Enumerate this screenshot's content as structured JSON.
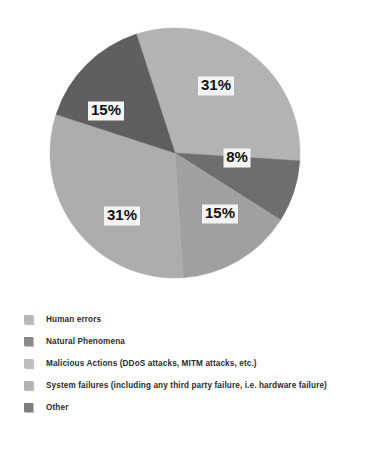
{
  "chart_data": {
    "type": "pie",
    "title": "",
    "subtitle": "",
    "xlabel": "",
    "ylabel": "",
    "legend_position": "bottom-left",
    "grid": false,
    "categories": [
      "Human errors",
      "Natural Phenomena",
      "Malicious Actions (DDoS attacks, MITM attacks, etc.)",
      "System failures (including any third party failure, i.e. hardware failure)",
      "Other"
    ],
    "values": [
      31,
      8,
      15,
      31,
      15
    ],
    "value_labels": [
      "31%",
      "8%",
      "15%",
      "31%",
      "15%"
    ],
    "colors": [
      "#b3b3b3",
      "#6e6e6e",
      "#a0a0a0",
      "#adadad",
      "#5f5f5f"
    ],
    "start_angle_deg": -18,
    "slices": [
      {
        "name": "Human errors",
        "value": 31,
        "label": "31%",
        "color": "#b3b3b3",
        "start_deg": -18,
        "end_deg": 93.6,
        "label_x": 216,
        "label_y": 86
      },
      {
        "name": "Natural Phenomena",
        "value": 8,
        "label": "8%",
        "color": "#6e6e6e",
        "start_deg": 93.6,
        "end_deg": 122.4,
        "label_x": 237,
        "label_y": 158
      },
      {
        "name": "Malicious Actions (DDoS attacks, MITM attacks, etc.)",
        "value": 15,
        "label": "15%",
        "color": "#a0a0a0",
        "start_deg": 122.4,
        "end_deg": 176.4,
        "label_x": 220,
        "label_y": 214
      },
      {
        "name": "System failures (including any third party failure, i.e. hardware failure)",
        "value": 31,
        "label": "31%",
        "color": "#adadad",
        "start_deg": 176.4,
        "end_deg": 288,
        "label_x": 122,
        "label_y": 216
      },
      {
        "name": "Other",
        "value": 15,
        "label": "15%",
        "color": "#5f5f5f",
        "start_deg": 288,
        "end_deg": 342,
        "label_x": 106,
        "label_y": 111
      }
    ],
    "geometry": {
      "center_x": 175,
      "center_y": 153,
      "radius": 125
    }
  },
  "legend": {
    "items": [
      {
        "label": "Human errors",
        "color": "#b9b9b9"
      },
      {
        "label": "Natural Phenomena",
        "color": "#8a8a8a"
      },
      {
        "label": "Malicious Actions (DDoS attacks, MITM attacks, etc.)",
        "color": "#bdbdbd"
      },
      {
        "label": "System failures (including any third party failure, i.e. hardware failure)",
        "color": "#b4b4b4"
      },
      {
        "label": "Other",
        "color": "#7d7d7d"
      }
    ]
  }
}
